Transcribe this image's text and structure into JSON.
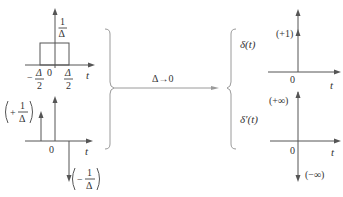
{
  "left_top": {
    "height_num": "1",
    "height_den": "Δ",
    "neg_half_num": "Δ",
    "neg_half_den": "2",
    "neg_sign": "−",
    "pos_half_num": "Δ",
    "pos_half_den": "2",
    "origin": "0",
    "axis": "t"
  },
  "left_bottom": {
    "pos_sign": "+",
    "pos_num": "1",
    "pos_den": "Δ",
    "neg_sign": "−",
    "neg_num": "1",
    "neg_den": "Δ",
    "origin": "0",
    "axis": "t"
  },
  "middle": {
    "limit_label": "Δ→0"
  },
  "right_top": {
    "function_label": "δ(t)",
    "strength": "(+1)",
    "origin": "0",
    "axis": "t"
  },
  "right_bottom": {
    "function_label": "δ′(t)",
    "upper": "(+∞)",
    "lower": "(−∞)",
    "origin": "0",
    "axis": "t"
  },
  "colors": {
    "stroke": "#555555",
    "brace": "#9a9a9a",
    "text": "#333333"
  }
}
